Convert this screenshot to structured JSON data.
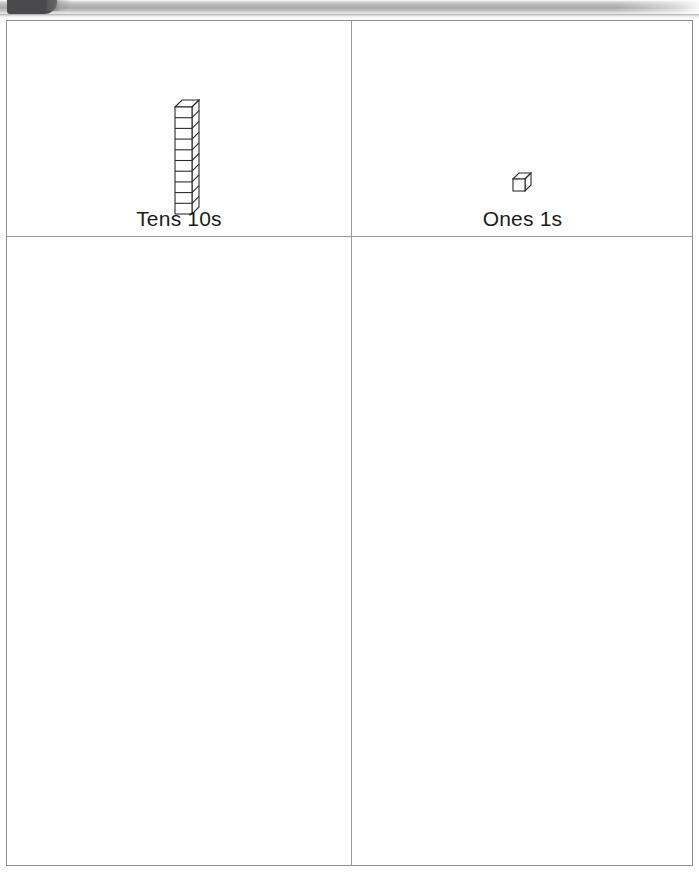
{
  "page": {
    "background_color": "#ffffff",
    "width": 699,
    "height": 876
  },
  "scan_chrome": {
    "tab_color": "#4a4a4c",
    "band_color": "#a9a9a9",
    "tab_name": "scan-edge-tab"
  },
  "table": {
    "border_color": "#8d8d90",
    "columns": [
      {
        "id": "tens",
        "label": "Tens 10s",
        "block_type": "tens-rod",
        "block_count": 1,
        "units_per_block": 10,
        "value": 10
      },
      {
        "id": "ones",
        "label": "Ones 1s",
        "block_type": "unit-cube",
        "block_count": 1,
        "units_per_block": 1,
        "value": 1
      }
    ],
    "answer_row": {
      "tens": "",
      "ones": ""
    }
  },
  "blocks": {
    "rod_segments": 10,
    "outline_color": "#2a2a2a",
    "fill_color": "#ffffff"
  },
  "represented_number": "11"
}
